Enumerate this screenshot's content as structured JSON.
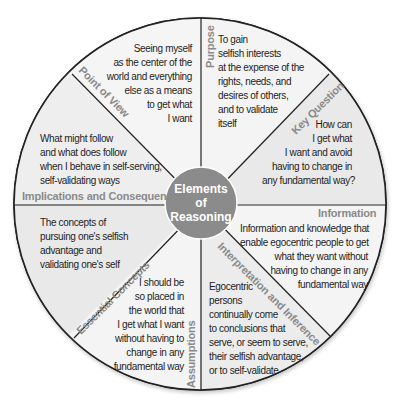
{
  "diagram": {
    "title_lines": [
      "Elements",
      "of",
      "Reasoning"
    ],
    "colors": {
      "segment_light": "#ebebeb",
      "segment_lighter": "#f5f5f5",
      "center_fill": "#8b8b8b",
      "label_gray": "#8a8a8a",
      "outline": "#222222",
      "text": "#1e1e1e"
    },
    "segments": [
      {
        "id": "purpose",
        "label": "Purpose",
        "lines": [
          "To gain",
          "selfish interests",
          "at the expense of the",
          "rights, needs, and",
          "desires of others,",
          "and to validate",
          "itself"
        ]
      },
      {
        "id": "key-question",
        "label": "Key Question",
        "lines": [
          "How can",
          "I get what",
          "I want and avoid",
          "having to change in",
          "any fundamental way?"
        ]
      },
      {
        "id": "information",
        "label": "Information",
        "lines": [
          "Information and knowledge that",
          "enable egocentric people to get",
          "what they want without",
          "having to change in any",
          "fundamental way"
        ]
      },
      {
        "id": "interpretation",
        "label": "Interpretation and Inference",
        "lines": [
          "Egocentric",
          "persons",
          "continually come",
          "to conclusions that",
          "serve, or seem to serve,",
          "their selfish advantage,",
          "or to self-validate"
        ]
      },
      {
        "id": "assumptions",
        "label": "Assumptions",
        "lines": [
          "I should be",
          "so placed in",
          "the world that",
          "I get what I want",
          "without having to",
          "change in any",
          "fundamental way"
        ]
      },
      {
        "id": "concepts",
        "label": "Essential Concepts",
        "lines": [
          "The concepts of",
          "pursuing one's selfish",
          "advantage and",
          "validating one's self"
        ]
      },
      {
        "id": "implications",
        "label": "Implications and Consequences",
        "lines": [
          "What might follow",
          "and what does follow",
          "when I behave in self-serving,",
          "self-validating ways"
        ]
      },
      {
        "id": "point-of-view",
        "label": "Point of View",
        "lines": [
          "Seeing myself",
          "as the center of the",
          "world and everything",
          "else as a means",
          "to get what",
          "I want"
        ]
      }
    ]
  }
}
